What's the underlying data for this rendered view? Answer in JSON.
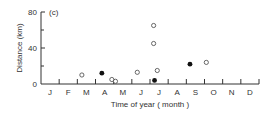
{
  "chart_data": {
    "type": "scatter",
    "panel_label": "(c)",
    "title": "",
    "xlabel": "Time of year (month)",
    "ylabel": "Distance (km)",
    "x_categories": [
      "J",
      "F",
      "M",
      "A",
      "M",
      "J",
      "J",
      "A",
      "S",
      "O",
      "N",
      "D"
    ],
    "y_ticks": [
      0,
      40,
      80
    ],
    "ylim": [
      0,
      80
    ],
    "xlim": [
      0,
      12
    ],
    "grid": false,
    "legend": null,
    "series": [
      {
        "name": "open circles",
        "marker": "open-circle",
        "points": [
          {
            "month": 2.25,
            "distance": 10
          },
          {
            "month": 3.9,
            "distance": 5
          },
          {
            "month": 4.1,
            "distance": 3
          },
          {
            "month": 5.3,
            "distance": 13
          },
          {
            "month": 6.2,
            "distance": 65
          },
          {
            "month": 6.2,
            "distance": 45
          },
          {
            "month": 6.4,
            "distance": 15
          },
          {
            "month": 9.1,
            "distance": 24
          }
        ]
      },
      {
        "name": "filled circles",
        "marker": "filled-circle",
        "points": [
          {
            "month": 3.35,
            "distance": 12
          },
          {
            "month": 6.25,
            "distance": 4
          },
          {
            "month": 8.2,
            "distance": 22
          }
        ]
      }
    ]
  }
}
